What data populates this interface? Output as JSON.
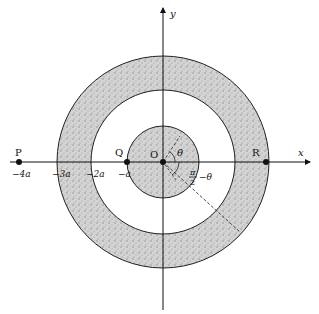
{
  "diagram": {
    "axes": {
      "x_label": "x",
      "y_label": "y"
    },
    "regions": [
      {
        "name": "inner-sphere",
        "inner_radius_a": 0,
        "outer_radius_a": 1,
        "fill": "stippled-gray"
      },
      {
        "name": "outer-shell",
        "inner_radius_a": 2,
        "outer_radius_a": 3,
        "fill": "stippled-gray"
      }
    ],
    "points": [
      {
        "label": "P",
        "x_a": -4
      },
      {
        "label": "Q",
        "x_a": -1
      },
      {
        "label": "O",
        "x_a": 0
      },
      {
        "label": "R",
        "x_a": 3
      }
    ],
    "tick_labels": [
      "−4a",
      "−3a",
      "−2a",
      "−a"
    ],
    "angle_labels": {
      "theta": "θ",
      "complement_num": "π",
      "complement_den": "2",
      "complement_suffix": "−θ"
    },
    "colors": {
      "ink": "#111111",
      "stipple": "#bdbdbd",
      "background": "#ffffff"
    }
  }
}
